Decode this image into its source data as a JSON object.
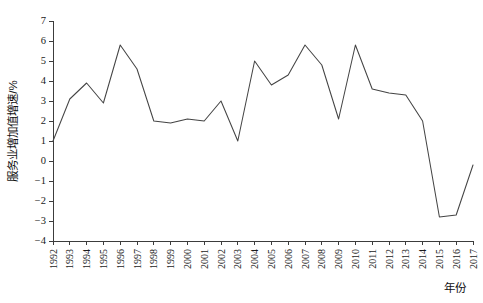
{
  "chart_data": {
    "type": "line",
    "title": "",
    "xlabel": "年份",
    "ylabel": "服务业增加值增速/%",
    "categories": [
      "1992",
      "1993",
      "1994",
      "1995",
      "1996",
      "1997",
      "1998",
      "1999",
      "2000",
      "2001",
      "2002",
      "2003",
      "2004",
      "2005",
      "2006",
      "2007",
      "2008",
      "2009",
      "2010",
      "2011",
      "2012",
      "2013",
      "2014",
      "2015",
      "2016",
      "2017"
    ],
    "values": [
      1.0,
      3.1,
      3.9,
      2.9,
      5.8,
      4.6,
      2.0,
      1.9,
      2.1,
      2.0,
      3.0,
      1.0,
      5.0,
      3.8,
      4.3,
      5.8,
      4.8,
      2.1,
      5.8,
      3.6,
      3.4,
      3.3,
      2.0,
      -2.8,
      -2.7,
      -0.2
    ],
    "ylim": [
      -4,
      7
    ],
    "ytick_labels": [
      "7",
      "6",
      "5",
      "4",
      "3",
      "2",
      "1",
      "0",
      "−1",
      "−2",
      "−3",
      "−4"
    ],
    "ytick_values": [
      7,
      6,
      5,
      4,
      3,
      2,
      1,
      0,
      -1,
      -2,
      -3,
      -4
    ],
    "xlim": [
      "1992",
      "2017"
    ],
    "grid": false,
    "legend": null,
    "legend_position": "none",
    "series_color": "#444444"
  },
  "axis": {
    "y_title": "服务业增加值增速/%",
    "x_title": "年份"
  }
}
